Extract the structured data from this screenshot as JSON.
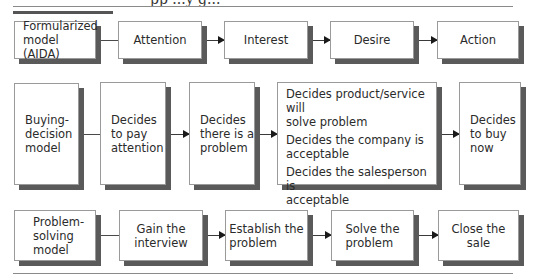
{
  "header": {
    "clipped_title": "pp ...y g..."
  },
  "rows": [
    {
      "name": "formularized-model",
      "label": "Formularized\nmodel (AIDA)",
      "steps": [
        "Attention",
        "Interest",
        "Desire",
        "Action"
      ]
    },
    {
      "name": "buying-decision-model",
      "label": "Buying-\ndecision\nmodel",
      "steps": [
        "Decides\nto pay\nattention",
        "Decides\nthere is a\nproblem",
        [
          "Decides product/service will\nsolve problem",
          "Decides the company is\nacceptable",
          "Decides the salesperson is\nacceptable"
        ],
        "Decides\nto buy\nnow"
      ]
    },
    {
      "name": "problem-solving-model",
      "label": "Problem-\nsolving\nmodel",
      "steps": [
        "Gain the\ninterview",
        "Establish the\nproblem",
        "Solve the\nproblem",
        "Close the sale"
      ]
    }
  ],
  "colors": {
    "box_border": "#9a9a9a",
    "box_shadow": "#5a5a5a",
    "rule": "#8a8a8a",
    "arrow": "#1a1a1a"
  }
}
